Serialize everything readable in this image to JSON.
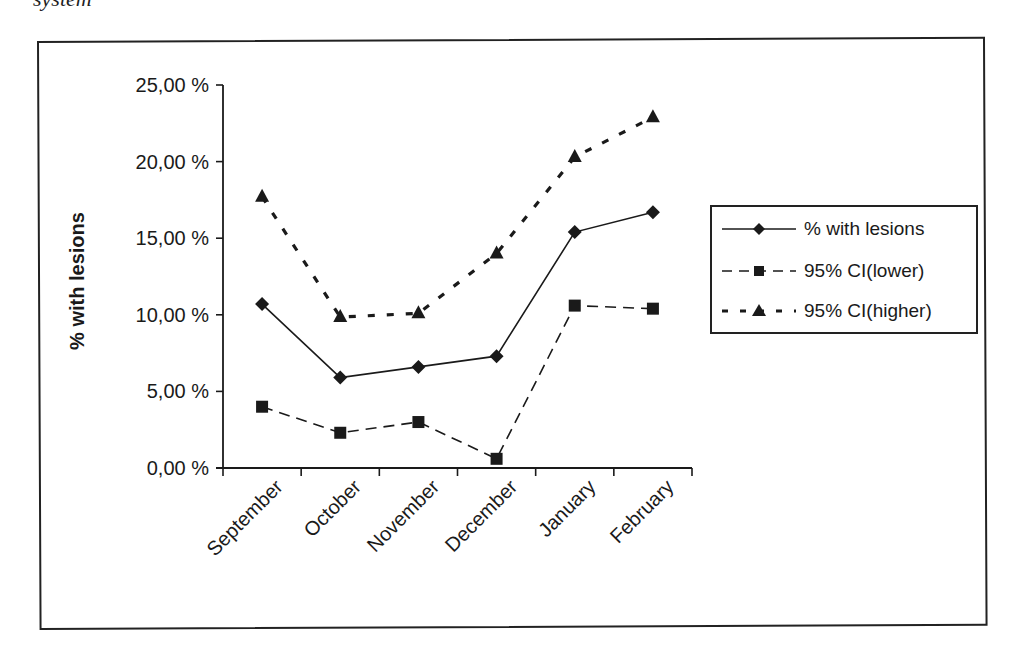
{
  "caption_fragment": "system",
  "chart_data": {
    "type": "line",
    "title": "",
    "xlabel": "",
    "ylabel": "% with lesions",
    "categories": [
      "September",
      "October",
      "November",
      "December",
      "January",
      "February"
    ],
    "series": [
      {
        "name": "% with lesions",
        "values": [
          10.7,
          5.9,
          6.6,
          7.3,
          15.4,
          16.7
        ],
        "line": "solid",
        "marker": "diamond"
      },
      {
        "name": "95% CI(lower)",
        "values": [
          4.0,
          2.3,
          3.0,
          0.6,
          10.6,
          10.4
        ],
        "line": "dashed",
        "marker": "square"
      },
      {
        "name": "95% CI(higher)",
        "values": [
          17.7,
          9.85,
          10.1,
          14.0,
          20.3,
          22.9
        ],
        "line": "dotted",
        "marker": "triangle"
      }
    ],
    "ylim": [
      0,
      25
    ],
    "yticks": [
      "0,00 %",
      "5,00 %",
      "10,00 %",
      "15,00 %",
      "20,00 %",
      "25,00 %"
    ],
    "grid": false,
    "legend_position": "right"
  },
  "legend": {
    "items": [
      {
        "label": "% with lesions"
      },
      {
        "label": "95% CI(lower)"
      },
      {
        "label": "95% CI(higher)"
      }
    ]
  },
  "colors": {
    "line": "#1a1a1a",
    "background": "#ffffff"
  }
}
